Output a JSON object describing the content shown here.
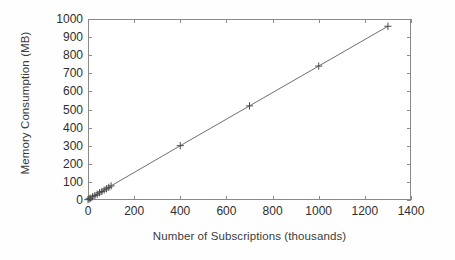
{
  "chart_data": {
    "type": "line",
    "title": "",
    "xlabel": "Number of Subscriptions (thousands)",
    "ylabel": "Memory Consumption (MB)",
    "xlim": [
      0,
      1400
    ],
    "ylim": [
      0,
      1000
    ],
    "xticks": [
      0,
      200,
      400,
      600,
      800,
      1000,
      1200,
      1400
    ],
    "yticks": [
      0,
      100,
      200,
      300,
      400,
      500,
      600,
      700,
      800,
      900,
      1000
    ],
    "xtick_labels": [
      "0",
      "200",
      "400",
      "600",
      "800",
      "1000",
      "1200",
      "1400"
    ],
    "ytick_labels": [
      "0",
      "100",
      "200",
      "300",
      "400",
      "500",
      "600",
      "700",
      "800",
      "900",
      "1000"
    ],
    "grid": false,
    "legend": null,
    "marker": "plus",
    "line_color": "#6f6f6f",
    "marker_color": "#4a4a4a",
    "frame_color": "#8a8a8a",
    "background": "#ffffff",
    "series": [
      {
        "name": "Memory Consumption",
        "x": [
          0,
          5,
          10,
          20,
          30,
          40,
          50,
          60,
          70,
          80,
          90,
          100,
          400,
          700,
          1000,
          1300
        ],
        "y": [
          2,
          6,
          10,
          18,
          25,
          32,
          40,
          47,
          55,
          62,
          70,
          78,
          300,
          520,
          740,
          960
        ]
      }
    ]
  }
}
